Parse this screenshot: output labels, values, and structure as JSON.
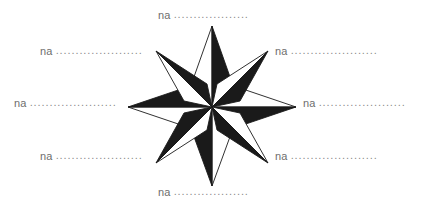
{
  "figure": {
    "type": "compass-rose-diagram",
    "background_color": "#ffffff",
    "label_color": "#6e6e6e",
    "leader_color": "#8a8a8a",
    "rose": {
      "name": "compass-rose",
      "points": 8,
      "fill_dark": "#1a1a1a",
      "fill_light": "#ffffff",
      "stroke": "#1a1a1a",
      "center_x": 212,
      "center_y": 107,
      "major_radius": 84,
      "minor_radius": 57
    }
  },
  "labels": [
    {
      "id": "north",
      "text": "na",
      "leader": "............................"
    },
    {
      "id": "northeast",
      "text": "na",
      "leader": "............................"
    },
    {
      "id": "east",
      "text": "na",
      "leader": "............................"
    },
    {
      "id": "southeast",
      "text": "na",
      "leader": "............................"
    },
    {
      "id": "south",
      "text": "na",
      "leader": "............................"
    },
    {
      "id": "southwest",
      "text": "na",
      "leader": "............................"
    },
    {
      "id": "west",
      "text": "na",
      "leader": "............................"
    },
    {
      "id": "northwest",
      "text": "na",
      "leader": "............................"
    }
  ]
}
